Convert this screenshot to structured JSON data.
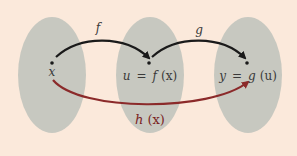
{
  "diagram": {
    "colors": {
      "background": "#fbe9db",
      "set_fill": "#c7c8c0",
      "arrow_black": "#1a1a1a",
      "arrow_composite": "#8b2a2a"
    },
    "sets": [
      {
        "id": "domain",
        "point_label": "x"
      },
      {
        "id": "middle",
        "point_label_left": "u",
        "eq": "=",
        "point_label_fn": "f",
        "point_label_arg": "(x)"
      },
      {
        "id": "codomain",
        "point_label_left": "y",
        "eq": "=",
        "point_label_fn": "g",
        "point_label_arg": "(u)"
      }
    ],
    "arrows": [
      {
        "id": "f",
        "label": "f",
        "from": "domain",
        "to": "middle"
      },
      {
        "id": "g",
        "label": "g",
        "from": "middle",
        "to": "codomain"
      },
      {
        "id": "h",
        "label_fn": "h",
        "label_arg": "(x)",
        "from": "domain",
        "to": "codomain"
      }
    ]
  }
}
